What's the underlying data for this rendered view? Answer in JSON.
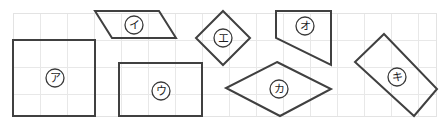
{
  "figure": {
    "width": 443,
    "height": 129,
    "background_color": "#ffffff",
    "stroke_color": "#404040",
    "grid": {
      "color": "#e8e8e8",
      "spacing": 27,
      "origin_x": 13,
      "origin_y": 13,
      "columns": 16,
      "rows": 4,
      "right_edge": 436,
      "bottom_edge": 116,
      "visible": true
    }
  },
  "shapes": [
    {
      "id": "shape-a",
      "label": "ア",
      "kind": "square",
      "points": "13,40 95,40 95,116 13,116",
      "label_x": 55,
      "label_y": 78,
      "label_r": 9
    },
    {
      "id": "shape-i",
      "label": "イ",
      "kind": "parallelogram",
      "points": "95,11 159,11 176,38 112,38",
      "label_x": 134,
      "label_y": 25,
      "label_r": 9
    },
    {
      "id": "shape-u",
      "label": "ウ",
      "kind": "rectangle",
      "points": "119,63 202,63 202,116 119,116",
      "label_x": 161,
      "label_y": 91,
      "label_r": 9
    },
    {
      "id": "shape-e",
      "label": "エ",
      "kind": "square-rotated",
      "points": "223,11 250,38 223,65 196,38",
      "label_x": 223,
      "label_y": 38,
      "label_r": 9
    },
    {
      "id": "shape-o",
      "label": "オ",
      "kind": "trapezoid",
      "points": "276,11 331,11 331,65 276,38",
      "label_x": 305,
      "label_y": 26,
      "label_r": 9
    },
    {
      "id": "shape-ka",
      "label": "カ",
      "kind": "rhombus",
      "points": "277,62 331,89 280,116 226,88",
      "label_x": 279,
      "label_y": 89,
      "label_r": 9
    },
    {
      "id": "shape-ki",
      "label": "キ",
      "kind": "rectangle-rotated",
      "points": "384,34 437,89 414,116 355,62",
      "label_x": 397,
      "label_y": 77,
      "label_r": 9
    }
  ]
}
